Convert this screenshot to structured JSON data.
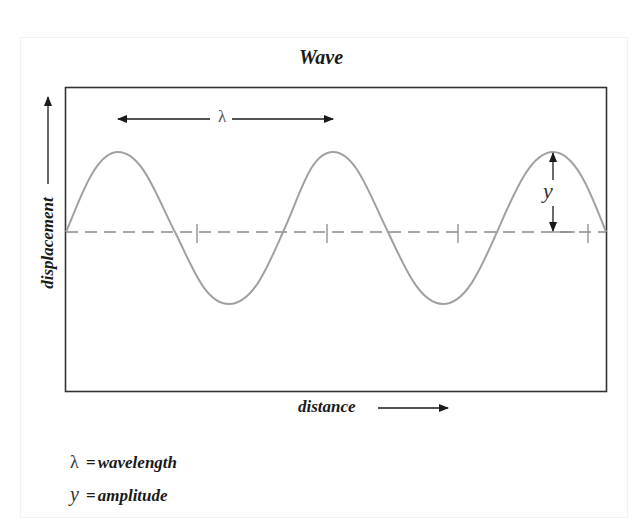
{
  "diagram": {
    "title": "Wave",
    "axes": {
      "y_label": "displacement",
      "x_label": "distance"
    },
    "annotations": {
      "wavelength_symbol": "λ",
      "amplitude_symbol": "y"
    },
    "legend": [
      {
        "symbol": "λ",
        "equals": "=",
        "text": "wavelength"
      },
      {
        "symbol": "y",
        "equals": "=",
        "text": "amplitude"
      }
    ],
    "colors": {
      "frame": "#333333",
      "wave": "#a0a0a0",
      "midline": "#8a8a8a",
      "arrows": "#1a1a1a",
      "text": "#1a1a1a"
    },
    "wave": {
      "cycles_shown": 2.5,
      "tick_marks_on_midline": 4
    }
  }
}
